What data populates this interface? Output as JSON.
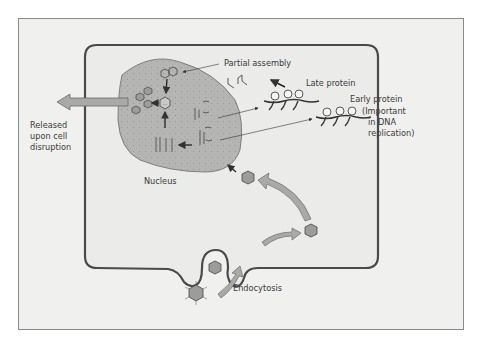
{
  "diagram": {
    "labels": {
      "partial_assembly": "Partial assembly",
      "late_protein": "Late protein",
      "early_protein": "Early protein",
      "early_protein_note_1": "(Important",
      "early_protein_note_2": "in DNA",
      "early_protein_note_3": "replication)",
      "released_1": "Released",
      "released_2": "upon cell",
      "released_3": "disruption",
      "nucleus": "Nucleus",
      "endocytosis": "Endocytosis"
    },
    "colors": {
      "background": "#f0f0ee",
      "cell_fill": "#ebebea",
      "cell_border": "#4a4a4a",
      "nucleus_fill": "#b5b5b3",
      "arrow_fill": "#a9a9a7",
      "virus_fill": "#9c9c9a",
      "text": "#3a3a3a"
    }
  }
}
